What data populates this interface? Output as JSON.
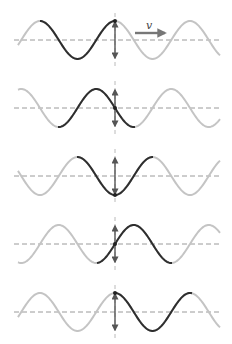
{
  "figure": {
    "velocity_label": "v",
    "colors": {
      "highlight_wave": "#2e2e2e",
      "faded_wave": "#c4c4c4",
      "baseline": "#9a9a9a",
      "arrow": "#555555"
    },
    "wavelength_px": 75,
    "amplitude_px": 19,
    "marker_x": 115,
    "x_start": 18,
    "x_end": 220,
    "panels": [
      {
        "name": "snapshot-1",
        "baseline_y": 40,
        "phase_at_marker": "crest",
        "dark_from": 40,
        "dark_to": 115,
        "marker_state": "top"
      },
      {
        "name": "snapshot-2",
        "baseline_y": 108,
        "phase_at_marker": "rising",
        "dark_from": 58,
        "dark_to": 135,
        "marker_state": "middle"
      },
      {
        "name": "snapshot-3",
        "baseline_y": 176,
        "phase_at_marker": "trough",
        "dark_from": 77,
        "dark_to": 153,
        "marker_state": "bottom"
      },
      {
        "name": "snapshot-4",
        "baseline_y": 244,
        "phase_at_marker": "falling",
        "dark_from": 97,
        "dark_to": 172,
        "marker_state": "middle"
      },
      {
        "name": "snapshot-5",
        "baseline_y": 312,
        "phase_at_marker": "crest",
        "dark_from": 115,
        "dark_to": 192,
        "marker_state": "top"
      }
    ]
  }
}
